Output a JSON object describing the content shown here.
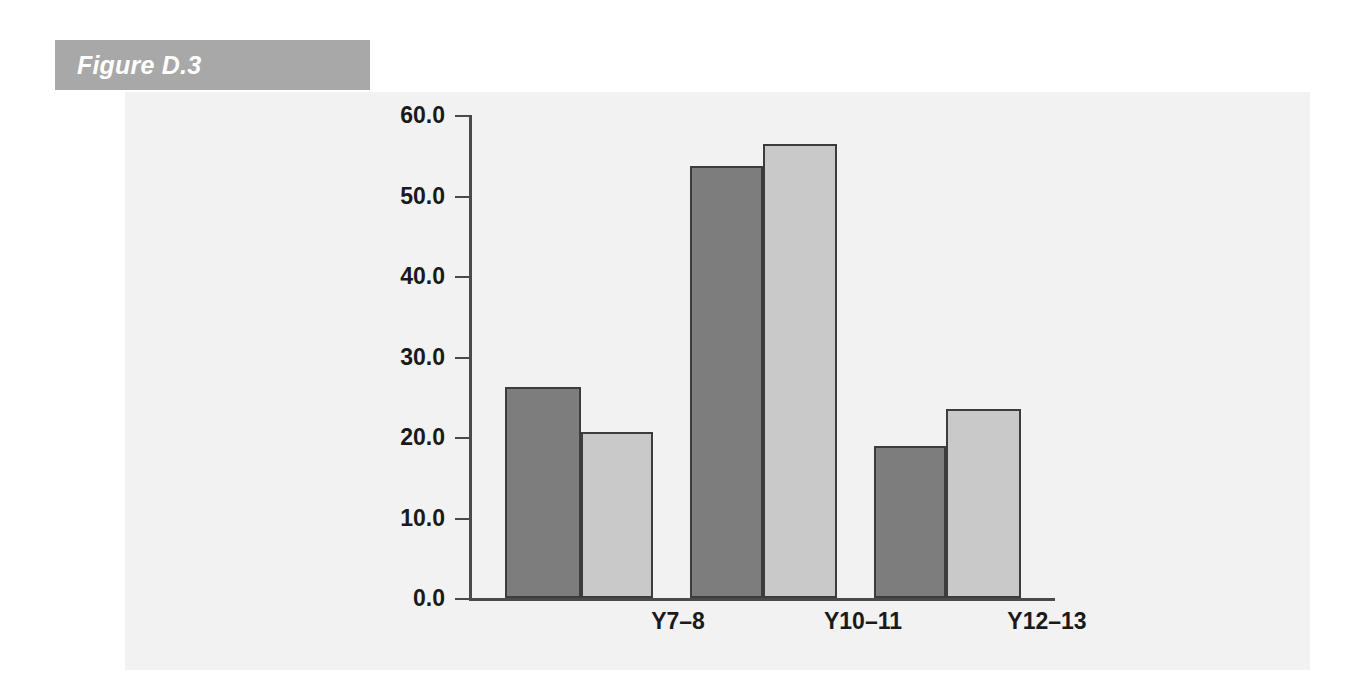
{
  "figure": {
    "banner_label": "Figure D.3",
    "banner_color": "#a8a8a8",
    "panel_color": "#f2f2f2"
  },
  "chart_data": {
    "type": "bar",
    "title": "Figure D.3",
    "xlabel": "",
    "ylabel": "",
    "categories": [
      "Y7–8",
      "Y10–11",
      "Y12–13"
    ],
    "series": [
      {
        "name": "series-1",
        "color": "#7d7d7d",
        "values": [
          26.2,
          53.7,
          18.9
        ]
      },
      {
        "name": "series-2",
        "color": "#c9c9c9",
        "values": [
          20.6,
          56.4,
          23.5
        ]
      }
    ],
    "ylim": [
      0.0,
      60.0
    ],
    "ytick_values": [
      0.0,
      10.0,
      20.0,
      30.0,
      40.0,
      50.0,
      60.0
    ],
    "ytick_labels": [
      "0.0",
      "10.0",
      "20.0",
      "30.0",
      "40.0",
      "50.0",
      "60.0"
    ],
    "grid": false,
    "legend": "none",
    "axis_color": "#4a4a4a",
    "bar_outline_color": "#3c3c3c"
  }
}
